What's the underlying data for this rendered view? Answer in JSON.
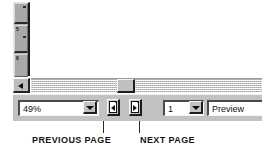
{
  "figure": {
    "background_color": "#ffffff"
  },
  "preview_pane": {
    "vertical_scrollbar": {
      "name": "vertical-scrollbar",
      "segments": [
        {
          "label": ""
        },
        {
          "label": "5"
        },
        {
          "label": "6"
        }
      ]
    },
    "horizontal_scrollbar": {
      "name": "horizontal-scrollbar",
      "left_arrow_label": "◄",
      "thumb_position_percent": 50
    }
  },
  "toolbar": {
    "zoom_combo": {
      "value": "49%",
      "placeholder": "49%",
      "dropdown_icon": "chevron-down-icon"
    },
    "previous_page_button": {
      "label": "",
      "icon": "page-previous-icon",
      "tooltip": "Previous Page"
    },
    "next_page_button": {
      "label": "",
      "icon": "page-next-icon",
      "tooltip": "Next Page"
    },
    "page_combo": {
      "value": "1",
      "placeholder": "1",
      "dropdown_icon": "chevron-down-icon"
    },
    "status_field": {
      "value": "Preview"
    }
  },
  "annotations": {
    "previous_page": "PREVIOUS PAGE",
    "next_page": "NEXT PAGE"
  },
  "colors": {
    "face": "#c2c2c2",
    "shadow": "#1c1c1c",
    "highlight": "#f4f4f4",
    "field_bg": "#ffffff",
    "text": "#111111"
  }
}
